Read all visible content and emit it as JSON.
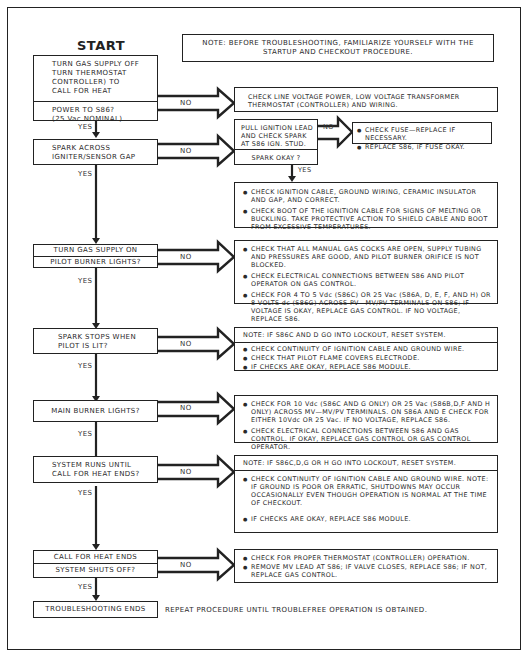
{
  "title": "START",
  "note_top": "NOTE: BEFORE TROUBLESHOOTING, FAMILIARIZE YOURSELF WITH THE STARTUP AND CHECKOUT PROCEDURE.",
  "note_top_lines": [
    "NOTE: BEFORE TROUBLESHOOTING, FAMILIARIZE YOURSELF WITH THE",
    "STARTUP AND CHECKOUT PROCEDURE."
  ],
  "labels": {
    "yes": "YES",
    "no": "NO"
  },
  "steps": [
    {
      "id": "step1",
      "action_lines": [
        "TURN GAS SUPPLY OFF",
        "TURN THERMOSTAT",
        "CONTROLLER) TO",
        "CALL FOR HEAT"
      ],
      "question_lines": [
        "POWER TO S86?",
        "(25 Vac NOMINAL)"
      ],
      "no_result_lines": [
        "CHECK LINE VOLTAGE POWER, LOW VOLTAGE TRANSFORMER",
        "THERMOSTAT (CONTROLLER) AND WIRING."
      ]
    },
    {
      "id": "step2",
      "question_lines": [
        "SPARK ACROSS",
        "IGNITER/SENSOR GAP"
      ],
      "sub_check": {
        "action_lines": [
          "PULL IGNITION LEAD",
          "AND CHECK SPARK",
          "AT S86 IGN. STUD."
        ],
        "question": "SPARK OKAY ?",
        "no_result": [
          "CHECK FUSE—REPLACE IF NECESSARY.",
          "REPLACE S86, IF FUSE OKAY."
        ]
      },
      "yes_result": [
        "CHECK IGNITION CABLE, GROUND WIRING, CERAMIC INSULATOR AND GAP, AND CORRECT.",
        "CHECK BOOT OF THE IGNITION CABLE FOR SIGNS OF MELTING OR BUCKLING. TAKE PROTECTIVE ACTION TO SHIELD CABLE AND BOOT FROM EXCESSIVE TEMPERATURES."
      ]
    },
    {
      "id": "step3",
      "action": "TURN GAS SUPPLY ON",
      "question": "PILOT BURNER LIGHTS?",
      "no_result": [
        "CHECK THAT ALL MANUAL GAS COCKS ARE OPEN, SUPPLY TUBING AND PRESSURES ARE GOOD, AND PILOT BURNER ORIFICE IS NOT BLOCKED.",
        "CHECK ELECTRICAL CONNECTIONS BETWEEN S86 AND PILOT OPERATOR ON GAS CONTROL.",
        "CHECK FOR 4 TO 5 Vdc (S86C) OR 25 Vac (S86A, D, E, F, AND H) OR 8 VOLTS dc (S86G) ACROSS PV—MV/PV TERMINALS ON S86; IF VOLTAGE IS OKAY, REPLACE GAS CONTROL. IF NO VOLTAGE, REPLACE S86."
      ]
    },
    {
      "id": "step4",
      "question_lines": [
        "SPARK STOPS WHEN",
        "PILOT IS LIT?"
      ],
      "no_note": "NOTE: IF S86C AND D GO INTO LOCKOUT, RESET SYSTEM.",
      "no_result": [
        "CHECK CONTINUITY OF IGNITION CABLE AND GROUND WIRE.",
        "CHECK THAT PILOT FLAME COVERS ELECTRODE.",
        "IF CHECKS ARE OKAY, REPLACE S86 MODULE."
      ]
    },
    {
      "id": "step5",
      "question": "MAIN BURNER LIGHTS?",
      "no_result": [
        "CHECK FOR 10 Vdc (S86C AND G ONLY) OR 25 Vac (S86B,D,F AND H ONLY) ACROSS MV—MV/PV TERMINALS. ON S86A AND E CHECK FOR EITHER 10Vdc OR 25 Vac. IF NO VOLTAGE, REPLACE S86.",
        "CHECK ELECTRICAL CONNECTIONS BETWEEN S86 AND GAS CONTROL. IF OKAY, REPLACE GAS CONTROL OR GAS CONTROL OPERATOR."
      ]
    },
    {
      "id": "step6",
      "question_lines": [
        "SYSTEM RUNS UNTIL",
        "CALL FOR HEAT ENDS?"
      ],
      "no_note": "NOTE: IF S86C,D,G OR H GO INTO LOCKOUT, RESET SYSTEM.",
      "no_result": [
        "CHECK CONTINUITY OF IGNITION CABLE AND GROUND WIRE. NOTE: IF GROUND IS POOR OR ERRATIC, SHUTDOWNS MAY OCCUR OCCASIONALLY EVEN THOUGH OPERATION IS NORMAL AT THE TIME OF CHECKOUT.",
        "IF CHECKS ARE OKAY, REPLACE S86 MODULE."
      ]
    },
    {
      "id": "step7",
      "action": "CALL FOR HEAT ENDS",
      "question": "SYSTEM SHUTS OFF?",
      "no_result": [
        "CHECK FOR PROPER THERMOSTAT (CONTROLLER) OPERATION.",
        "REMOVE MV LEAD AT S86; IF VALVE CLOSES, REPLACE S86; IF NOT, REPLACE GAS CONTROL."
      ]
    }
  ],
  "end": {
    "label": "TROUBLESHOOTING ENDS",
    "note": "REPEAT PROCEDURE UNTIL TROUBLEFREE OPERATION IS OBTAINED."
  },
  "colors": {
    "ink": "#222222",
    "background": "#ffffff"
  }
}
